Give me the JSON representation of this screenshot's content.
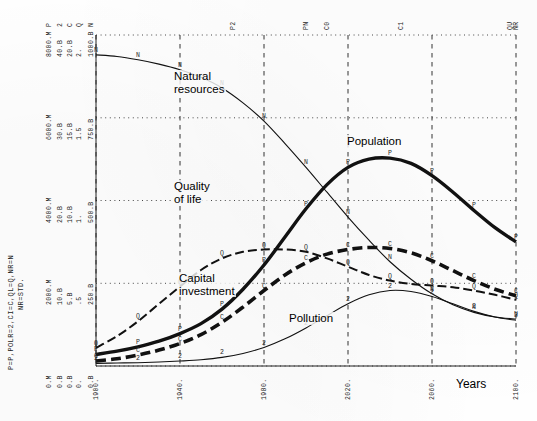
{
  "chart_data": {
    "type": "line",
    "title": "",
    "xlabel": "Years",
    "ylabel": "",
    "grid": true,
    "legend": "inline-annotations",
    "xlim": [
      1900,
      2100
    ],
    "xticks": [
      "1900.",
      "1940.",
      "1980.",
      "2020.",
      "2060.",
      "2100."
    ],
    "top_markers": [
      {
        "label": "P2",
        "x": 1965
      },
      {
        "label": "PN",
        "x": 2000
      },
      {
        "label": "C0",
        "x": 2010
      },
      {
        "label": "C1",
        "x": 2045
      },
      {
        "label": "QU",
        "x": 2097
      },
      {
        "label": "NR",
        "x": 2100
      }
    ],
    "axis_scale_rows": [
      {
        "codes": "P  2  C  Q  N",
        "values": "8000.M  40.B  20.B  2.  1000.B"
      },
      {
        "codes": "",
        "values": "6000.M  30.B  15.B  1.5  750.B"
      },
      {
        "codes": "",
        "values": "4000.M  20.B  10.B  1.  500.B"
      },
      {
        "codes": "",
        "values": "2000.M  10.B  5.B  .5  250.B"
      },
      {
        "codes": "",
        "values": "0.M  0.B  0.B  0.  0.B"
      }
    ],
    "axis_columns": [
      {
        "code": "P",
        "unit": "M",
        "ticks": [
          "8000.M",
          "6000.M",
          "4000.M",
          "2000.M",
          "0.M"
        ]
      },
      {
        "code": "2",
        "unit": "B",
        "ticks": [
          "40.B",
          "30.B",
          "20.B",
          "10.B",
          "0.B"
        ]
      },
      {
        "code": "C",
        "unit": "B",
        "ticks": [
          "20.B",
          "15.B",
          "10.B",
          "5.B",
          "0.B"
        ]
      },
      {
        "code": "Q",
        "unit": "",
        "ticks": [
          "2.",
          "1.5",
          "1.",
          ".5",
          "0."
        ]
      },
      {
        "code": "N",
        "unit": "B",
        "ticks": [
          "1000.B",
          "750.B",
          "500.B",
          "250.B",
          "0.B"
        ]
      }
    ],
    "legend_key": "P=P,POLR=2,CI=C,QL=Q,NR=N",
    "legend_note": "NR=STD.",
    "series": [
      {
        "name": "Natural resources",
        "marker": "N",
        "style": "thin-solid",
        "label_x": 173,
        "label_y": 70,
        "points": [
          [
            1900,
            0.94
          ],
          [
            1910,
            0.935
          ],
          [
            1920,
            0.925
          ],
          [
            1930,
            0.912
          ],
          [
            1940,
            0.895
          ],
          [
            1950,
            0.872
          ],
          [
            1960,
            0.84
          ],
          [
            1970,
            0.795
          ],
          [
            1980,
            0.74
          ],
          [
            1990,
            0.672
          ],
          [
            2000,
            0.6
          ],
          [
            2010,
            0.525
          ],
          [
            2020,
            0.45
          ],
          [
            2030,
            0.38
          ],
          [
            2040,
            0.315
          ],
          [
            2050,
            0.262
          ],
          [
            2060,
            0.218
          ],
          [
            2070,
            0.185
          ],
          [
            2080,
            0.162
          ],
          [
            2090,
            0.148
          ],
          [
            2100,
            0.142
          ]
        ]
      },
      {
        "name": "Population",
        "marker": "P",
        "style": "thick-solid",
        "label_x": 346,
        "label_y": 135,
        "points": [
          [
            1900,
            0.035
          ],
          [
            1910,
            0.045
          ],
          [
            1920,
            0.058
          ],
          [
            1930,
            0.075
          ],
          [
            1940,
            0.098
          ],
          [
            1950,
            0.128
          ],
          [
            1960,
            0.172
          ],
          [
            1970,
            0.232
          ],
          [
            1980,
            0.305
          ],
          [
            1990,
            0.39
          ],
          [
            2000,
            0.475
          ],
          [
            2010,
            0.548
          ],
          [
            2020,
            0.6
          ],
          [
            2030,
            0.625
          ],
          [
            2040,
            0.628
          ],
          [
            2050,
            0.612
          ],
          [
            2060,
            0.575
          ],
          [
            2070,
            0.525
          ],
          [
            2080,
            0.47
          ],
          [
            2090,
            0.418
          ],
          [
            2100,
            0.375
          ]
        ]
      },
      {
        "name": "Quality of life",
        "marker": "Q",
        "style": "dashed-thin",
        "label_x": 173,
        "label_y": 180,
        "points": [
          [
            1900,
            0.055
          ],
          [
            1910,
            0.09
          ],
          [
            1920,
            0.135
          ],
          [
            1930,
            0.188
          ],
          [
            1940,
            0.24
          ],
          [
            1950,
            0.29
          ],
          [
            1960,
            0.325
          ],
          [
            1970,
            0.345
          ],
          [
            1980,
            0.352
          ],
          [
            1990,
            0.352
          ],
          [
            2000,
            0.345
          ],
          [
            2010,
            0.325
          ],
          [
            2020,
            0.3
          ],
          [
            2030,
            0.275
          ],
          [
            2040,
            0.258
          ],
          [
            2050,
            0.248
          ],
          [
            2060,
            0.243
          ],
          [
            2070,
            0.238
          ],
          [
            2080,
            0.228
          ],
          [
            2090,
            0.215
          ],
          [
            2100,
            0.2
          ]
        ]
      },
      {
        "name": "Capital investment",
        "marker": "C",
        "style": "dashed-thick",
        "label_x": 178,
        "label_y": 272,
        "points": [
          [
            1900,
            0.015
          ],
          [
            1910,
            0.022
          ],
          [
            1920,
            0.033
          ],
          [
            1930,
            0.048
          ],
          [
            1940,
            0.068
          ],
          [
            1950,
            0.095
          ],
          [
            1960,
            0.132
          ],
          [
            1970,
            0.178
          ],
          [
            1980,
            0.228
          ],
          [
            1990,
            0.275
          ],
          [
            2000,
            0.312
          ],
          [
            2010,
            0.338
          ],
          [
            2020,
            0.352
          ],
          [
            2030,
            0.358
          ],
          [
            2040,
            0.355
          ],
          [
            2050,
            0.342
          ],
          [
            2060,
            0.318
          ],
          [
            2070,
            0.288
          ],
          [
            2080,
            0.258
          ],
          [
            2090,
            0.232
          ],
          [
            2100,
            0.212
          ]
        ]
      },
      {
        "name": "Pollution",
        "marker": "2",
        "style": "thin-solid",
        "label_x": 288,
        "label_y": 312,
        "points": [
          [
            1900,
            0.008
          ],
          [
            1910,
            0.009
          ],
          [
            1920,
            0.01
          ],
          [
            1930,
            0.012
          ],
          [
            1940,
            0.015
          ],
          [
            1950,
            0.019
          ],
          [
            1960,
            0.026
          ],
          [
            1970,
            0.038
          ],
          [
            1980,
            0.056
          ],
          [
            1990,
            0.082
          ],
          [
            2000,
            0.115
          ],
          [
            2010,
            0.152
          ],
          [
            2020,
            0.188
          ],
          [
            2030,
            0.215
          ],
          [
            2040,
            0.228
          ],
          [
            2050,
            0.225
          ],
          [
            2060,
            0.21
          ],
          [
            2070,
            0.188
          ],
          [
            2080,
            0.165
          ],
          [
            2090,
            0.148
          ],
          [
            2100,
            0.138
          ]
        ]
      }
    ]
  },
  "labels": {
    "years": "Years"
  },
  "colors": {
    "ink": "#111111",
    "grid": "#333333",
    "background": "#ffffff"
  }
}
